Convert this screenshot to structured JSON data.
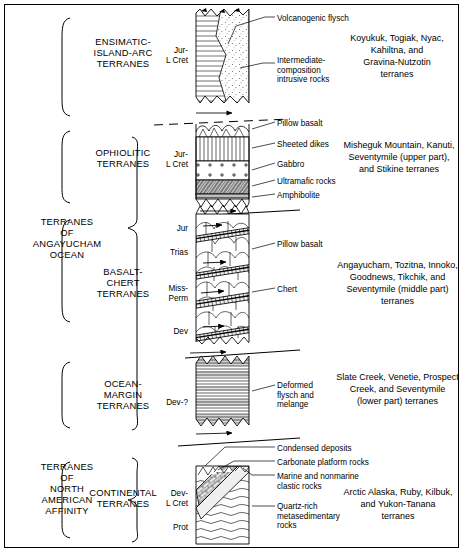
{
  "figure": {
    "type": "stratigraphic-column-diagram"
  },
  "groups": [
    {
      "id": "angayucham",
      "label": "TERRANES\nOF\nANGAYUCHAM\nOCEAN"
    },
    {
      "id": "north-american",
      "label": "TERRANES\nOF\nNORTH\nAMERICAN\nAFFINITY"
    }
  ],
  "sections": [
    {
      "id": "ensimatic-island-arc",
      "label": "ENSIMATIC-\nISLAND-ARC\nTERRANES",
      "age": "Jur-\nL Cret",
      "terranes": "Koyukuk, Togiak, Nyac,\nKahiltna, and\nGravina-Nutzotin\nterranes",
      "callouts": [
        {
          "id": "volcanogenic-flysch",
          "text": "Volcanogenic flysch"
        },
        {
          "id": "intermediate-intrusive",
          "text": "Intermediate-\ncomposition\nintrusive rocks"
        }
      ]
    },
    {
      "id": "ophiolitic",
      "label": "OPHIOLITIC\nTERRANES",
      "age": "Jur-\nL Cret",
      "terranes": "Misheguk Mountain, Kanuti,\nSeventymile (upper part),\nand Stikine terranes",
      "callouts": [
        {
          "id": "pillow-basalt",
          "text": "Pillow basalt"
        },
        {
          "id": "sheeted-dikes",
          "text": "Sheeted dikes"
        },
        {
          "id": "gabbro",
          "text": "Gabbro"
        },
        {
          "id": "ultramafic-rocks",
          "text": "Ultramafic rocks"
        },
        {
          "id": "amphibolite",
          "text": "Amphibolite"
        }
      ]
    },
    {
      "id": "basalt-chert",
      "label": "BASALT-\nCHERT\nTERRANES",
      "ages": [
        "Jur",
        "Trias",
        "Miss-\nPerm",
        "Dev"
      ],
      "terranes": "Angayucham, Tozitna, Innoko,\nGoodnews, Tikchik, and\nSeventymile (middle part)\nterranes",
      "callouts": [
        {
          "id": "pillow-basalt",
          "text": "Pillow basalt"
        },
        {
          "id": "chert",
          "text": "Chert"
        }
      ]
    },
    {
      "id": "ocean-margin",
      "label": "OCEAN-\nMARGIN\nTERRANES",
      "age": "Dev-?",
      "terranes": "Slate Creek, Venetie, Prospect\nCreek, and Seventymile\n(lower part) terranes",
      "callouts": [
        {
          "id": "deformed-flysch-melange",
          "text": "Deformed\nflysch and\nmelange"
        }
      ]
    },
    {
      "id": "continental",
      "label": "CONTINENTAL\nTERRANES",
      "ages": [
        "Dev-\nL Cret",
        "Prot"
      ],
      "terranes": "Arctic Alaska, Ruby, Kilbuk,\nand Yukon-Tanana\nterranes",
      "callouts": [
        {
          "id": "condensed-deposits",
          "text": "Condensed deposits"
        },
        {
          "id": "carbonate-platform-rocks",
          "text": "Carbonate platform rocks"
        },
        {
          "id": "marine-nonmarine-clastic",
          "text": "Marine and nonmarine\nclastic rocks"
        },
        {
          "id": "quartz-rich-metasedimentary",
          "text": "Quartz-rich\nmetasedimentary\nrocks"
        }
      ]
    }
  ],
  "colors": {
    "ink": "#000000",
    "background": "#ffffff",
    "fill_light": "#f2f2f2",
    "fill_mid": "#d9d9d9"
  }
}
